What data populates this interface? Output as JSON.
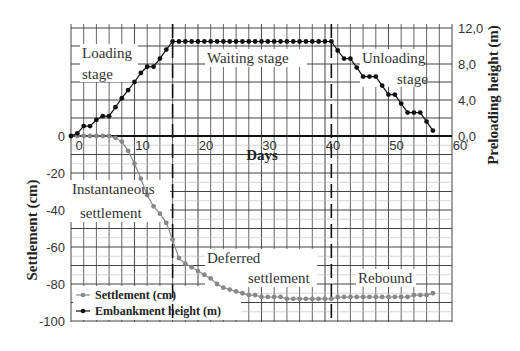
{
  "chart_data": {
    "type": "line",
    "title": "",
    "xlabel": "Days",
    "ylabel_left": "Settlement (cm)",
    "ylabel_right": "Preloading height (m)",
    "xlim": [
      0,
      60
    ],
    "ylim_left": [
      -100,
      0
    ],
    "ylim_right": [
      0.0,
      12.0
    ],
    "grid": true,
    "legend_position": "lower left",
    "x_ticks": [
      "0",
      "10",
      "20",
      "30",
      "40",
      "50",
      "60"
    ],
    "y_left_ticks": [
      "0",
      "-20",
      "-40",
      "-60",
      "-80",
      "-100"
    ],
    "y_right_ticks": [
      "0,0",
      "4,0",
      "8,0",
      "12,0"
    ],
    "series": [
      {
        "name": "Settlement (cm)",
        "axis": "left",
        "color": "#888888",
        "x": [
          0,
          1,
          2,
          3,
          4,
          5,
          6,
          7,
          8,
          9,
          10,
          11,
          12,
          13,
          14,
          15,
          16,
          17,
          18,
          19,
          20,
          21,
          22,
          23,
          24,
          25,
          26,
          27,
          28,
          29,
          30,
          31,
          32,
          33,
          34,
          35,
          36,
          37,
          38,
          39,
          40,
          41,
          42,
          43,
          44,
          45,
          46,
          47,
          48,
          49,
          50,
          51,
          52,
          53,
          54,
          55,
          56,
          57
        ],
        "values": [
          0,
          0,
          0,
          0,
          0,
          0,
          0,
          -1,
          -3,
          -8,
          -15,
          -23,
          -32,
          -38,
          -42,
          -47,
          -56,
          -66,
          -69,
          -71,
          -73,
          -75,
          -77,
          -80,
          -82,
          -83,
          -84,
          -85,
          -86,
          -86,
          -87,
          -87,
          -87,
          -87,
          -88,
          -88,
          -88,
          -88,
          -88,
          -88,
          -88,
          -88,
          -87,
          -87,
          -87,
          -87,
          -87,
          -87,
          -87,
          -87,
          -87,
          -87,
          -87,
          -87,
          -86,
          -86,
          -86,
          -85
        ]
      },
      {
        "name": "Embankment height (m)",
        "axis": "right",
        "color": "#111111",
        "x": [
          0,
          1,
          2,
          3,
          4,
          5,
          6,
          7,
          8,
          9,
          10,
          11,
          12,
          13,
          14,
          15,
          16,
          17,
          18,
          19,
          20,
          21,
          22,
          23,
          24,
          25,
          26,
          27,
          28,
          29,
          30,
          31,
          32,
          33,
          34,
          35,
          36,
          37,
          38,
          39,
          40,
          41,
          42,
          43,
          44,
          45,
          46,
          47,
          48,
          49,
          50,
          51,
          52,
          53,
          54,
          55,
          56,
          57
        ],
        "values": [
          0,
          0.3,
          1.1,
          1.1,
          1.8,
          2.2,
          2.2,
          3.2,
          4.2,
          5.1,
          6.0,
          7.0,
          7.7,
          7.7,
          8.6,
          9.6,
          10.5,
          10.5,
          10.5,
          10.5,
          10.5,
          10.5,
          10.5,
          10.5,
          10.5,
          10.5,
          10.5,
          10.5,
          10.5,
          10.5,
          10.5,
          10.5,
          10.5,
          10.5,
          10.5,
          10.5,
          10.5,
          10.5,
          10.5,
          10.5,
          10.5,
          10.5,
          9.5,
          8.6,
          8.6,
          7.6,
          6.6,
          6.6,
          6.6,
          5.6,
          4.6,
          4.6,
          3.6,
          2.6,
          2.6,
          2.6,
          1.6,
          0.6
        ]
      }
    ],
    "stage_boundaries_days": [
      16,
      41
    ],
    "annotations": [
      "Loading stage",
      "Waiting stage",
      "Unloading stage",
      "Instantaneous settlement",
      "Deferred settlement",
      "Rebound"
    ]
  },
  "labels": {
    "x_axis": "Days",
    "y_left": "Settlement (cm)",
    "y_right": "Preloading height (m)",
    "loading_1": "Loading",
    "loading_2": "stage",
    "waiting": "Waiting stage",
    "unloading_1": "Unloading",
    "unloading_2": "stage",
    "instant_1": "Instantaneous",
    "instant_2": "settlement",
    "deferred_1": "Deferred",
    "deferred_2": "settlement",
    "rebound": "Rebound",
    "legend_settlement": "Settlement (cm)",
    "legend_embankment": "Embankment height (m)"
  }
}
